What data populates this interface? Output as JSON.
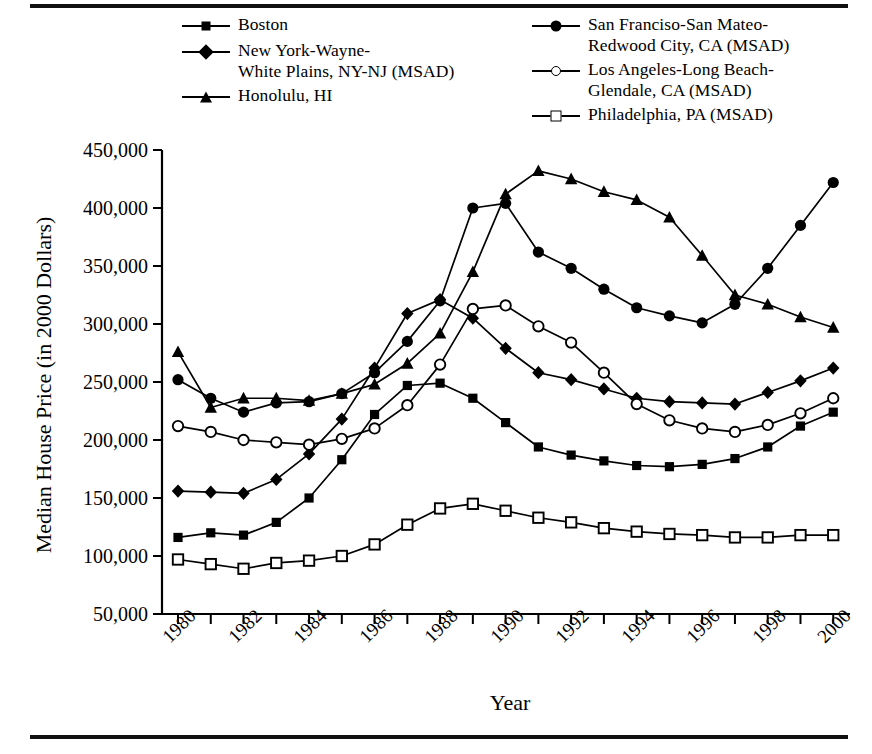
{
  "figure": {
    "rule_top": "horizontal-rule",
    "rule_bottom": "horizontal-rule"
  },
  "legend": {
    "entries": [
      {
        "label": "Boston",
        "marker": "square-filled",
        "column": "left"
      },
      {
        "label": "New York-Wayne-\nWhite Plains, NY-NJ (MSAD)",
        "marker": "diamond-filled",
        "column": "left"
      },
      {
        "label": "Honolulu, HI",
        "marker": "triangle-filled",
        "column": "left"
      },
      {
        "label": "San Franciso-San Mateo-\nRedwood City, CA (MSAD)",
        "marker": "circle-filled",
        "column": "right"
      },
      {
        "label": "Los Angeles-Long Beach-\nGlendale, CA (MSAD)",
        "marker": "circle-open",
        "column": "right"
      },
      {
        "label": "Philadelphia, PA (MSAD)",
        "marker": "square-open",
        "column": "right"
      }
    ]
  },
  "chart_data": {
    "type": "line",
    "title": "",
    "xlabel": "Year",
    "ylabel": "Median House Price (in 2000 Dollars)",
    "xlim": [
      1980,
      2001
    ],
    "ylim": [
      50000,
      450000
    ],
    "grid": false,
    "legend_position": "top",
    "y_ticks": [
      50000,
      100000,
      150000,
      200000,
      250000,
      300000,
      350000,
      400000,
      450000
    ],
    "y_tick_labels": [
      "50,000",
      "100,000",
      "150,000",
      "200,000",
      "250,000",
      "300,000",
      "350,000",
      "400,000",
      "450,000"
    ],
    "x_ticks": [
      1980,
      1981,
      1982,
      1983,
      1984,
      1985,
      1986,
      1987,
      1988,
      1989,
      1990,
      1991,
      1992,
      1993,
      1994,
      1995,
      1996,
      1997,
      1998,
      1999,
      2000
    ],
    "x_tick_labels": [
      "1980",
      "",
      "1982",
      "",
      "1984",
      "",
      "1986",
      "",
      "1988",
      "",
      "1990",
      "",
      "1992",
      "",
      "1994",
      "",
      "1996",
      "",
      "1998",
      "",
      "2000"
    ],
    "x": [
      1980,
      1981,
      1982,
      1983,
      1984,
      1985,
      1986,
      1987,
      1988,
      1989,
      1990,
      1991,
      1992,
      1993,
      1994,
      1995,
      1996,
      1997,
      1998,
      1999,
      2000
    ],
    "series": [
      {
        "name": "Boston",
        "marker": "square-filled",
        "values": [
          116000,
          120000,
          118000,
          129000,
          150000,
          183000,
          222000,
          247000,
          249000,
          236000,
          215000,
          194000,
          187000,
          182000,
          178000,
          177000,
          179000,
          184000,
          194000,
          212000,
          224000
        ]
      },
      {
        "name": "New York-Wayne-White Plains, NY-NJ (MSAD)",
        "marker": "diamond-filled",
        "values": [
          156000,
          155000,
          154000,
          166000,
          188000,
          218000,
          262000,
          309000,
          321000,
          305000,
          279000,
          258000,
          252000,
          244000,
          236000,
          233000,
          232000,
          231000,
          241000,
          251000,
          262000
        ]
      },
      {
        "name": "Honolulu, HI",
        "marker": "triangle-filled",
        "values": [
          276000,
          228000,
          236000,
          236000,
          234000,
          240000,
          248000,
          266000,
          292000,
          345000,
          412000,
          432000,
          425000,
          414000,
          407000,
          392000,
          359000,
          325000,
          317000,
          306000,
          297000
        ]
      },
      {
        "name": "San Franciso-San Mateo-Redwood City, CA (MSAD)",
        "marker": "circle-filled",
        "values": [
          252000,
          236000,
          224000,
          232000,
          233000,
          240000,
          258000,
          285000,
          320000,
          400000,
          404000,
          362000,
          348000,
          330000,
          314000,
          307000,
          301000,
          317000,
          348000,
          385000,
          422000
        ]
      },
      {
        "name": "Los Angeles-Long Beach-Glendale, CA (MSAD)",
        "marker": "circle-open",
        "values": [
          212000,
          207000,
          200000,
          198000,
          196000,
          201000,
          210000,
          230000,
          265000,
          313000,
          316000,
          298000,
          284000,
          258000,
          231000,
          217000,
          210000,
          207000,
          213000,
          223000,
          236000
        ]
      },
      {
        "name": "Philadelphia, PA (MSAD)",
        "marker": "square-open",
        "values": [
          97000,
          93000,
          89000,
          94000,
          96000,
          100000,
          110000,
          127000,
          141000,
          145000,
          139000,
          133000,
          129000,
          124000,
          121000,
          119000,
          118000,
          116000,
          116000,
          118000,
          118000
        ]
      }
    ]
  }
}
